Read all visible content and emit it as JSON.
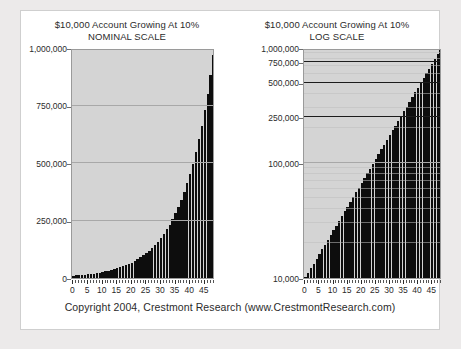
{
  "footer": {
    "text": "Copyright 2004, Crestmont Research (www.CrestmontResearch.com)"
  },
  "colors": {
    "page_background": "#eceaea",
    "panel_background": "#ffffff",
    "plot_background": "#d4d4d4",
    "bar_color": "#0d0d0d",
    "gridline_light": "#a8a8a8",
    "gridline_dark": "#1c1c1c",
    "text_color": "#2b2b2b"
  },
  "chart_data": [
    {
      "type": "bar",
      "id": "nominal",
      "title": "$10,000 Account Growing At 10%",
      "subtitle": "NOMINAL SCALE",
      "xlabel": "",
      "ylabel": "",
      "yscale": "linear",
      "ylim": [
        0,
        1000000
      ],
      "xlim": [
        0,
        48
      ],
      "grid": true,
      "legend": "none",
      "ytick_labels": [
        "1,000,000",
        "750,000",
        "500,000",
        "250,000",
        "0"
      ],
      "ytick_values": [
        1000000,
        750000,
        500000,
        250000,
        0
      ],
      "xtick_labels": [
        "0",
        "5",
        "10",
        "15",
        "20",
        "25",
        "30",
        "35",
        "40",
        "45"
      ],
      "xtick_values": [
        0,
        5,
        10,
        15,
        20,
        25,
        30,
        35,
        40,
        45
      ],
      "x": [
        0,
        1,
        2,
        3,
        4,
        5,
        6,
        7,
        8,
        9,
        10,
        11,
        12,
        13,
        14,
        15,
        16,
        17,
        18,
        19,
        20,
        21,
        22,
        23,
        24,
        25,
        26,
        27,
        28,
        29,
        30,
        31,
        32,
        33,
        34,
        35,
        36,
        37,
        38,
        39,
        40,
        41,
        42,
        43,
        44,
        45,
        46,
        47,
        48
      ],
      "values": [
        10000,
        11000,
        12100,
        13310,
        14641,
        16105,
        17716,
        19487,
        21436,
        23579,
        25937,
        28531,
        31384,
        34523,
        37975,
        41772,
        45950,
        50545,
        55599,
        61159,
        67275,
        74002,
        81403,
        89543,
        98497,
        108347,
        119182,
        131100,
        144210,
        158631,
        174494,
        191943,
        211138,
        232252,
        255477,
        281024,
        309127,
        340039,
        374043,
        411447,
        452593,
        497851,
        547637,
        602406,
        662660,
        728905,
        801795,
        881975,
        970166
      ],
      "last_value": 970166,
      "series_name": "Account Value"
    },
    {
      "type": "bar",
      "id": "log",
      "title": "$10,000 Account Growing At 10%",
      "subtitle": "LOG SCALE",
      "xlabel": "",
      "ylabel": "",
      "yscale": "log",
      "ylim": [
        10000,
        1000000
      ],
      "xlim": [
        0,
        48
      ],
      "grid": true,
      "legend": "none",
      "ytick_labels": [
        "1,000,000",
        "750,000",
        "500,000",
        "250,000",
        "100,000",
        "10,000"
      ],
      "ytick_values": [
        1000000,
        750000,
        500000,
        250000,
        100000,
        10000
      ],
      "xtick_labels": [
        "0",
        "5",
        "10",
        "15",
        "20",
        "25",
        "30",
        "35",
        "40",
        "45"
      ],
      "xtick_values": [
        0,
        5,
        10,
        15,
        20,
        25,
        30,
        35,
        40,
        45
      ],
      "x": [
        0,
        1,
        2,
        3,
        4,
        5,
        6,
        7,
        8,
        9,
        10,
        11,
        12,
        13,
        14,
        15,
        16,
        17,
        18,
        19,
        20,
        21,
        22,
        23,
        24,
        25,
        26,
        27,
        28,
        29,
        30,
        31,
        32,
        33,
        34,
        35,
        36,
        37,
        38,
        39,
        40,
        41,
        42,
        43,
        44,
        45,
        46,
        47,
        48
      ],
      "values": [
        10000,
        11000,
        12100,
        13310,
        14641,
        16105,
        17716,
        19487,
        21436,
        23579,
        25937,
        28531,
        31384,
        34523,
        37975,
        41772,
        45950,
        50545,
        55599,
        61159,
        67275,
        74002,
        81403,
        89543,
        98497,
        108347,
        119182,
        131100,
        144210,
        158631,
        174494,
        191943,
        211138,
        232252,
        255477,
        281024,
        309127,
        340039,
        374043,
        411447,
        452593,
        497851,
        547637,
        602406,
        662660,
        728905,
        801795,
        881975,
        970166
      ],
      "last_value": 970166,
      "series_name": "Account Value"
    }
  ]
}
